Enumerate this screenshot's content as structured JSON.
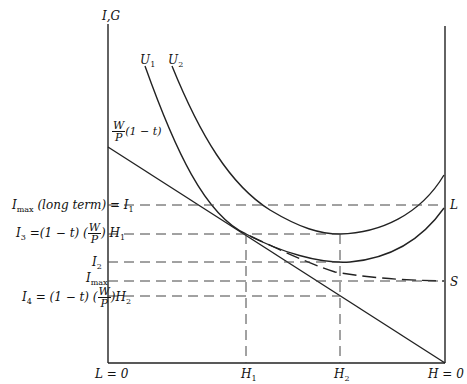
{
  "diagram": {
    "y_axis_label": "I,G",
    "curves": [
      "U1",
      "U2"
    ],
    "curve_labels": {
      "u1_main": "U",
      "u1_sub": "1",
      "u2_main": "U",
      "u2_sub": "2"
    },
    "budget_intercept": {
      "num": "W",
      "den": "P",
      "tail": "(1 − t)"
    },
    "y_labels": {
      "i1": {
        "pre": "I",
        "sub": "max",
        "mid": " (long term) = I",
        "sub2": "1"
      },
      "i3": {
        "pre": "I",
        "sub": "3",
        "mid": " =(1 − t) (",
        "num": "W",
        "den": "P",
        "post": ") H",
        "sub2": "1"
      },
      "i2": {
        "pre": "I",
        "sub": "2"
      },
      "imax": {
        "pre": "I",
        "sub": "max"
      },
      "i4": {
        "pre": "I",
        "sub": "4",
        "mid": " = (1 − t) (",
        "num": "W",
        "den": "P",
        "post": ")H",
        "sub2": "2"
      }
    },
    "right_labels": {
      "L": "L",
      "S": "S"
    },
    "x_labels": {
      "l0": "L = 0",
      "h1_main": "H",
      "h1_sub": "1",
      "h2_main": "H",
      "h2_sub": "2",
      "h0": "H = 0"
    }
  }
}
